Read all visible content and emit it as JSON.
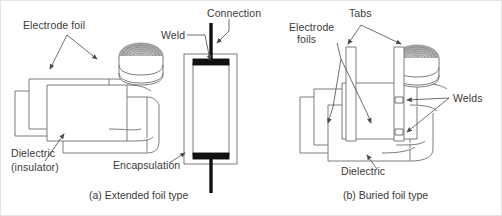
{
  "figure": {
    "background": "#ffffff",
    "border_color": "#e3e3e3",
    "line_color": "#6d6d6d",
    "text_color": "#3a3a3a",
    "lead_color": "#111111"
  },
  "panel_a": {
    "caption": "(a) Extended foil type",
    "labels": {
      "electrode_foil": "Electrode foil",
      "dielectric_line1": "Dielectric",
      "dielectric_line2": "(insulator)",
      "weld": "Weld",
      "connection": "Connection",
      "encapsulation": "Encapsulation"
    }
  },
  "panel_b": {
    "caption": "(b) Buried foil type",
    "labels": {
      "tabs": "Tabs",
      "electrode_foils_line1": "Electrode",
      "electrode_foils_line2": "foils",
      "welds": "Welds",
      "dielectric": "Dielectric"
    }
  }
}
